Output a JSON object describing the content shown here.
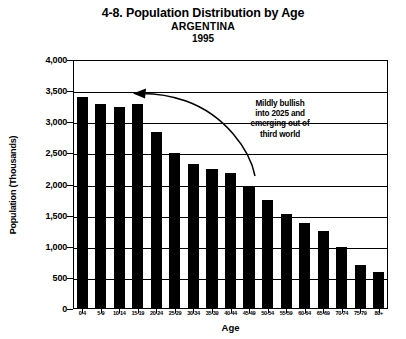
{
  "chart_data": {
    "type": "bar",
    "title": "4-8. Population Distribution by Age",
    "subtitle": "ARGENTINA",
    "year": "1995",
    "xlabel": "Age",
    "ylabel": "Population (Thousands)",
    "ylim": [
      0,
      4000
    ],
    "ytick_labels": [
      "4,000",
      "3,500",
      "3,000",
      "2,500",
      "2,000",
      "1,500",
      "1,000",
      "500",
      "0"
    ],
    "ytick_values": [
      4000,
      3500,
      3000,
      2500,
      2000,
      1500,
      1000,
      500,
      0
    ],
    "grid": true,
    "legend": "none",
    "bar_color": "#000000",
    "categories": [
      "0-4",
      "5-9",
      "10-14",
      "15-19",
      "20-24",
      "25-29",
      "30-34",
      "35-39",
      "40-44",
      "45-49",
      "50-54",
      "55-59",
      "60-64",
      "65-69",
      "70-74",
      "75-79",
      "80+"
    ],
    "values": [
      3400,
      3300,
      3250,
      3300,
      2850,
      2500,
      2330,
      2250,
      2180,
      1970,
      1750,
      1520,
      1380,
      1250,
      990,
      700,
      590
    ],
    "annotations": [
      {
        "text_lines": [
          "Mildly bullish",
          "into 2025 and",
          "emerging out of",
          "third world"
        ],
        "arrow": "curved arrow pointing from annotation text leftward to the 15-19 age bar"
      }
    ]
  }
}
